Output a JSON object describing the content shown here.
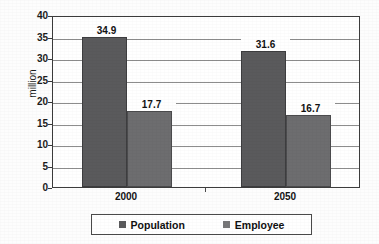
{
  "chart_data": {
    "type": "bar",
    "title": "",
    "subtitle": "",
    "xlabel": "",
    "ylabel": "million",
    "categories": [
      "2000",
      "2050"
    ],
    "series": [
      {
        "name": "Population",
        "values": [
          34.9,
          31.6
        ],
        "color": "#5a5a5c"
      },
      {
        "name": "Employee",
        "values": [
          17.7,
          16.7
        ],
        "color": "#6d6d6f"
      }
    ],
    "value_labels": [
      [
        "34.9",
        "17.7"
      ],
      [
        "31.6",
        "16.7"
      ]
    ],
    "ylim": [
      0,
      40
    ],
    "ytick_step": 5,
    "ytick_labels": [
      "0",
      "5",
      "10",
      "15",
      "20",
      "25",
      "30",
      "35",
      "40"
    ],
    "grid": true,
    "grid_axis": "y",
    "legend_position": "bottom",
    "legend_entries": [
      "Population",
      "Employee"
    ],
    "bar_grouping": "adjacent",
    "frame": true
  },
  "axes": {
    "y_title": "million"
  },
  "legend": {
    "items": [
      {
        "label": "Population",
        "swatch": "legend-swatch-population"
      },
      {
        "label": "Employee",
        "swatch": "legend-swatch-employee"
      }
    ]
  },
  "colors": {
    "series_population": "#5a5a5c",
    "series_employee": "#6d6d6f",
    "gridline": "#8d8d8d",
    "frame": "#3c3c3c",
    "text": "#121212",
    "background": "#fdfdfd"
  }
}
